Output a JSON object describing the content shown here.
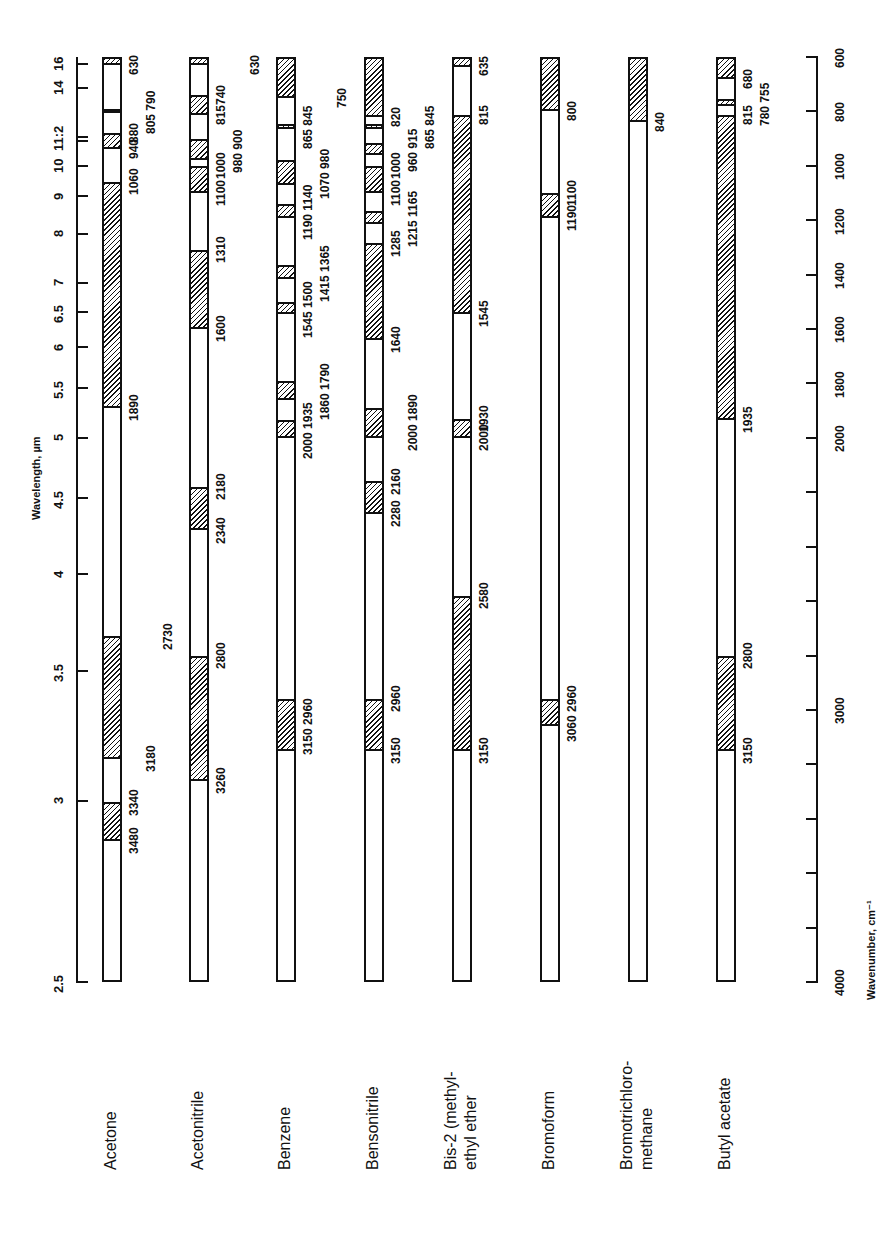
{
  "chart_data": {
    "type": "bar",
    "title": "",
    "orientation": "rotated-90",
    "xlabel_top": "Wavelength, µm",
    "xlabel_bottom": "Wavenumber, cm⁻¹",
    "wavenumber_range": [
      600,
      4000
    ],
    "wavelength_ticks": [
      {
        "label": "16",
        "wn": 625
      },
      {
        "label": "14",
        "wn": 714
      },
      {
        "label": "11:2",
        "wn": 893
      },
      {
        "label": "",
        "wn": 909
      },
      {
        "label": "10",
        "wn": 1000
      },
      {
        "label": "9",
        "wn": 1111
      },
      {
        "label": "8",
        "wn": 1250
      },
      {
        "label": "7",
        "wn": 1429
      },
      {
        "label": "6.5",
        "wn": 1538
      },
      {
        "label": "6",
        "wn": 1667
      },
      {
        "label": "5.5",
        "wn": 1818
      },
      {
        "label": "5",
        "wn": 2000
      },
      {
        "label": "4.5",
        "wn": 2222
      },
      {
        "label": "4",
        "wn": 2500
      },
      {
        "label": "3.5",
        "wn": 2857
      },
      {
        "label": "3",
        "wn": 3333
      },
      {
        "label": "2.5",
        "wn": 4000
      }
    ],
    "wavenumber_ticks": [
      600,
      800,
      1000,
      1200,
      1400,
      1600,
      1800,
      2000,
      3000,
      4000
    ],
    "wavenumber_minor_step": 200,
    "legend": {
      "hatched": "absorbing (opaque) region",
      "open": "transparent region"
    },
    "series": [
      {
        "name": "Acetone",
        "hatched": [
          [
            600,
            630
          ],
          [
            790,
            805
          ],
          [
            880,
            940
          ],
          [
            1060,
            1890
          ],
          [
            3180,
            2730
          ],
          [
            3340,
            3480
          ]
        ],
        "labels": [
          {
            "text": "630",
            "wn": 630,
            "col": 0
          },
          {
            "text": "805 790",
            "wn": 798,
            "col": 1
          },
          {
            "text": "880",
            "wn": 880,
            "col": 0
          },
          {
            "text": "940",
            "wn": 940,
            "col": 0
          },
          {
            "text": "1060",
            "wn": 1060,
            "col": 0
          },
          {
            "text": "1890",
            "wn": 1890,
            "col": 0
          },
          {
            "text": "2730",
            "wn": 2730,
            "col": 2
          },
          {
            "text": "3180",
            "wn": 3180,
            "col": 1
          },
          {
            "text": "3340",
            "wn": 3340,
            "col": 0
          },
          {
            "text": "3480",
            "wn": 3480,
            "col": 0
          }
        ]
      },
      {
        "name": "Acetonitrile",
        "hatched": [
          [
            600,
            630
          ],
          [
            740,
            815
          ],
          [
            900,
            980
          ],
          [
            1000,
            1100
          ],
          [
            1310,
            1600
          ],
          [
            2180,
            2340
          ],
          [
            2800,
            3260
          ]
        ],
        "labels": [
          {
            "text": "630",
            "wn": 630,
            "col": 2
          },
          {
            "text": "740",
            "wn": 740,
            "col": 0
          },
          {
            "text": "815",
            "wn": 815,
            "col": 0
          },
          {
            "text": "980 900",
            "wn": 940,
            "col": 1
          },
          {
            "text": "1000",
            "wn": 1000,
            "col": 0
          },
          {
            "text": "1100",
            "wn": 1100,
            "col": 0
          },
          {
            "text": "1310",
            "wn": 1310,
            "col": 0
          },
          {
            "text": "1600",
            "wn": 1600,
            "col": 0
          },
          {
            "text": "2180",
            "wn": 2180,
            "col": 0
          },
          {
            "text": "2340",
            "wn": 2340,
            "col": 0
          },
          {
            "text": "2800",
            "wn": 2800,
            "col": 0
          },
          {
            "text": "3260",
            "wn": 3260,
            "col": 0
          }
        ]
      },
      {
        "name": "Benzene",
        "hatched": [
          [
            600,
            750
          ],
          [
            845,
            865
          ],
          [
            980,
            1070
          ],
          [
            1140,
            1190
          ],
          [
            1365,
            1415
          ],
          [
            1500,
            1545
          ],
          [
            1790,
            1860
          ],
          [
            1935,
            2000
          ],
          [
            2960,
            3150
          ]
        ],
        "labels": [
          {
            "text": "750",
            "wn": 750,
            "col": 2
          },
          {
            "text": "865 845",
            "wn": 855,
            "col": 0
          },
          {
            "text": "1070 980",
            "wn": 1025,
            "col": 1
          },
          {
            "text": "1190 1140",
            "wn": 1165,
            "col": 0
          },
          {
            "text": "1415 1365",
            "wn": 1390,
            "col": 1
          },
          {
            "text": "1545 1500",
            "wn": 1522,
            "col": 0
          },
          {
            "text": "1860 1790",
            "wn": 1825,
            "col": 1
          },
          {
            "text": "2000 1935",
            "wn": 1968,
            "col": 0
          },
          {
            "text": "3150 2960",
            "wn": 3055,
            "col": 0
          }
        ]
      },
      {
        "name": "Bensonitrile",
        "hatched": [
          [
            600,
            820
          ],
          [
            845,
            865
          ],
          [
            915,
            960
          ],
          [
            1000,
            1100
          ],
          [
            1165,
            1215
          ],
          [
            1285,
            1640
          ],
          [
            1890,
            2000
          ],
          [
            2160,
            2280
          ],
          [
            2960,
            3150
          ]
        ],
        "labels": [
          {
            "text": "820",
            "wn": 820,
            "col": 0
          },
          {
            "text": "865 845",
            "wn": 855,
            "col": 2
          },
          {
            "text": "960 915",
            "wn": 938,
            "col": 1
          },
          {
            "text": "1000",
            "wn": 1000,
            "col": 0
          },
          {
            "text": "1100",
            "wn": 1100,
            "col": 0
          },
          {
            "text": "1215 1165",
            "wn": 1190,
            "col": 1
          },
          {
            "text": "1285",
            "wn": 1285,
            "col": 0
          },
          {
            "text": "1640",
            "wn": 1640,
            "col": 0
          },
          {
            "text": "1890",
            "wn": 1890,
            "col": 1
          },
          {
            "text": "2000",
            "wn": 2000,
            "col": 1
          },
          {
            "text": "2160",
            "wn": 2160,
            "col": 0
          },
          {
            "text": "2280",
            "wn": 2280,
            "col": 0
          },
          {
            "text": "2960",
            "wn": 2960,
            "col": 0
          },
          {
            "text": "3150",
            "wn": 3150,
            "col": 0
          }
        ]
      },
      {
        "name": "Bis-2 (methyl-ethyl ether",
        "hatched": [
          [
            600,
            635
          ],
          [
            815,
            1545
          ],
          [
            1930,
            2000
          ],
          [
            2580,
            3150
          ]
        ],
        "labels": [
          {
            "text": "635",
            "wn": 635,
            "col": 0
          },
          {
            "text": "815",
            "wn": 815,
            "col": 0
          },
          {
            "text": "1545",
            "wn": 1545,
            "col": 0
          },
          {
            "text": "1930",
            "wn": 1930,
            "col": 0
          },
          {
            "text": "2000",
            "wn": 2000,
            "col": 0
          },
          {
            "text": "2580",
            "wn": 2580,
            "col": 0
          },
          {
            "text": "3150",
            "wn": 3150,
            "col": 0
          }
        ]
      },
      {
        "name": "Bromoform",
        "hatched": [
          [
            600,
            800
          ],
          [
            1100,
            1190
          ],
          [
            2960,
            3060
          ]
        ],
        "labels": [
          {
            "text": "800",
            "wn": 800,
            "col": 0
          },
          {
            "text": "1100",
            "wn": 1100,
            "col": 0
          },
          {
            "text": "1190",
            "wn": 1190,
            "col": 0
          },
          {
            "text": "3060 2960",
            "wn": 3010,
            "col": 0
          }
        ]
      },
      {
        "name": "Bromotrichloro-methane",
        "hatched": [
          [
            600,
            840
          ]
        ],
        "labels": [
          {
            "text": "840",
            "wn": 840,
            "col": 0
          }
        ]
      },
      {
        "name": "Butyl acetate",
        "hatched": [
          [
            600,
            680
          ],
          [
            755,
            780
          ],
          [
            815,
            1935
          ],
          [
            2800,
            3150
          ]
        ],
        "labels": [
          {
            "text": "680",
            "wn": 680,
            "col": 0
          },
          {
            "text": "780 755",
            "wn": 768,
            "col": 1
          },
          {
            "text": "815",
            "wn": 815,
            "col": 0
          },
          {
            "text": "1935",
            "wn": 1935,
            "col": 0
          },
          {
            "text": "2800",
            "wn": 2800,
            "col": 0
          },
          {
            "text": "3150",
            "wn": 3150,
            "col": 0
          }
        ]
      }
    ]
  },
  "labels": {
    "wavelength_axis_title": "Wavelength, µm",
    "wavenumber_axis_title": "Wavenumber, cm⁻¹",
    "compound_names": [
      [
        "Acetone"
      ],
      [
        "Acetonitrile"
      ],
      [
        "Benzene"
      ],
      [
        "Bensonitrile"
      ],
      [
        "Bis-2 (methyl-",
        "ethyl ether"
      ],
      [
        "Bromoform"
      ],
      [
        "Bromotrichloro-",
        "methane"
      ],
      [
        "Butyl  acetate"
      ]
    ]
  }
}
